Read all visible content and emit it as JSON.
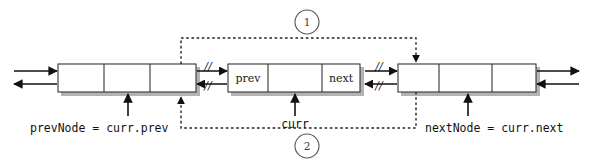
{
  "diagram": {
    "colors": {
      "stroke": "#111111",
      "node_fill": "#ffffff",
      "node_border": "#333333",
      "shadow": "#b3b3b3",
      "dotted": "#222222",
      "text": "#111111",
      "background": "#ffffff"
    },
    "nodes": [
      {
        "id": "prev-node",
        "name": "prevNode",
        "cells": [
          {
            "id": "prev-node-prev-cell",
            "label": ""
          },
          {
            "id": "prev-node-data-cell",
            "label": ""
          },
          {
            "id": "prev-node-next-cell",
            "label": ""
          }
        ]
      },
      {
        "id": "curr-node",
        "name": "curr",
        "cells": [
          {
            "id": "curr-node-prev-cell",
            "label": "prev"
          },
          {
            "id": "curr-node-data-cell",
            "label": ""
          },
          {
            "id": "curr-node-next-cell",
            "label": "next"
          }
        ]
      },
      {
        "id": "next-node",
        "name": "nextNode",
        "cells": [
          {
            "id": "next-node-prev-cell",
            "label": ""
          },
          {
            "id": "next-node-data-cell",
            "label": ""
          },
          {
            "id": "next-node-next-cell",
            "label": ""
          }
        ]
      }
    ],
    "pointer_labels": [
      {
        "id": "prev-node-pointer-label",
        "text": "prevNode = curr.prev"
      },
      {
        "id": "curr-pointer-label",
        "text": "curr"
      },
      {
        "id": "next-node-pointer-label",
        "text": "nextNode = curr.next"
      }
    ],
    "steps": [
      {
        "id": "step-1",
        "text": "1"
      },
      {
        "id": "step-2",
        "text": "2"
      }
    ],
    "severed_links": [
      {
        "id": "severed-link-top-left",
        "text": "//"
      },
      {
        "id": "severed-link-bottom-left",
        "text": "//"
      },
      {
        "id": "severed-link-top-right",
        "text": "//"
      },
      {
        "id": "severed-link-bottom-right",
        "text": "//"
      }
    ]
  }
}
